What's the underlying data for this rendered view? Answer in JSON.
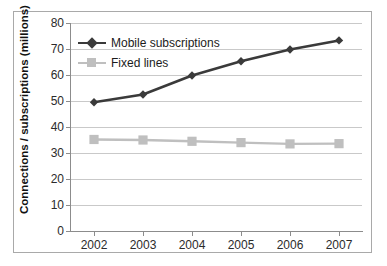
{
  "chart_data": {
    "type": "line",
    "title": "",
    "xlabel": "",
    "ylabel": "Connections / subscriptions (millions)",
    "categories": [
      "2002",
      "2003",
      "2004",
      "2005",
      "2006",
      "2007"
    ],
    "x": [
      2002,
      2003,
      2004,
      2005,
      2006,
      2007
    ],
    "ylim": [
      0,
      80
    ],
    "yticks": [
      0,
      10,
      20,
      30,
      40,
      50,
      60,
      70,
      80
    ],
    "ytick_labels": [
      "0",
      "10",
      "20",
      "30",
      "40",
      "50",
      "60",
      "70",
      "80"
    ],
    "grid": "horizontal",
    "legend_position": "upper-left-inside",
    "series": [
      {
        "name": "Mobile subscriptions",
        "values": [
          49.5,
          52.5,
          59.8,
          65.3,
          69.8,
          73.3
        ],
        "color": "#3a3a3a",
        "marker": "diamond"
      },
      {
        "name": "Fixed lines",
        "values": [
          35.2,
          35.0,
          34.5,
          34.0,
          33.5,
          33.6
        ],
        "color": "#bfbfbf",
        "marker": "square"
      }
    ]
  },
  "legend": {
    "items": [
      {
        "label": "Mobile subscriptions",
        "color": "#3a3a3a",
        "marker": "diamond"
      },
      {
        "label": "Fixed lines",
        "color": "#bfbfbf",
        "marker": "square"
      }
    ]
  },
  "axes": {
    "y_title": "Connections / subscriptions (millions)",
    "y_labels": [
      "80",
      "70",
      "60",
      "50",
      "40",
      "30",
      "20",
      "10",
      "0"
    ],
    "x_labels": [
      "2002",
      "2003",
      "2004",
      "2005",
      "2006",
      "2007"
    ]
  },
  "colors": {
    "mobile": "#3a3a3a",
    "fixed": "#bfbfbf",
    "grid": "#c9c9c9",
    "axis": "#8c8c8c",
    "frame": "#a9a9a9",
    "text": "#2b2b2b",
    "background": "#ffffff"
  }
}
